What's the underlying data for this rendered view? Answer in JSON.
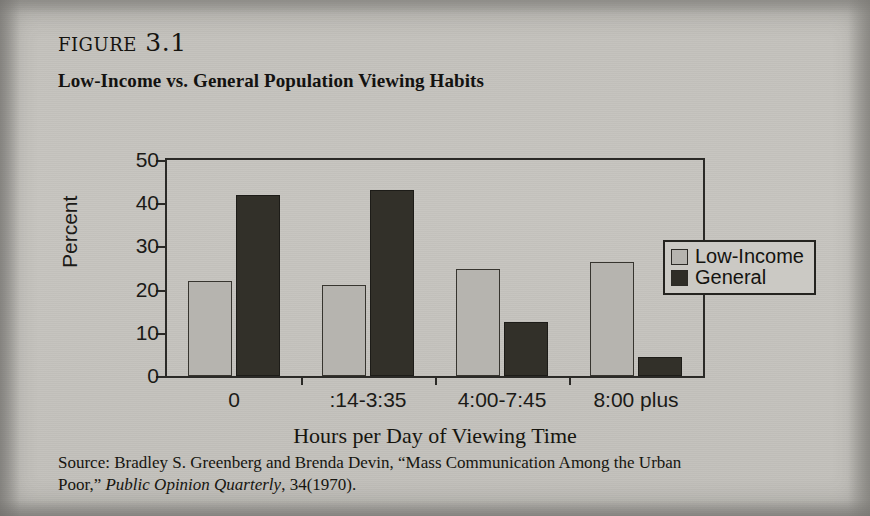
{
  "figure": {
    "label": "figure 3.1",
    "subtitle": "Low-Income vs. General Population Viewing Habits"
  },
  "legend": {
    "items": [
      {
        "label": "Low-Income",
        "color": "#b6b4af",
        "swatch": "light-gray-square"
      },
      {
        "label": "General",
        "color": "#2f2d27",
        "swatch": "black-square"
      }
    ]
  },
  "source": {
    "line1_prefix": "Source: Bradley S. Greenberg and Brenda Devin, “Mass Communication Among the Urban",
    "line2_prefix": "Poor,” ",
    "journal": "Public Opinion Quarterly",
    "line2_suffix": ", 34(1970)."
  },
  "chart_data": {
    "type": "bar",
    "title": "Low-Income vs. General Population Viewing Habits",
    "categories": [
      "0",
      ":14-3:35",
      "4:00-7:45",
      "8:00 plus"
    ],
    "series": [
      {
        "name": "Low-Income",
        "values": [
          22.0,
          21.0,
          24.7,
          26.5
        ],
        "color": "#b6b4af"
      },
      {
        "name": "General",
        "values": [
          42.0,
          43.0,
          12.6,
          4.5
        ],
        "color": "#2f2d27"
      }
    ],
    "xlabel": "Hours per Day of Viewing Time",
    "ylabel": "Percent",
    "ylim": [
      0,
      50
    ],
    "yticks": [
      0,
      10,
      20,
      30,
      40,
      50
    ],
    "ytick_labels": [
      "0",
      "10",
      "20",
      "30",
      "40",
      "50"
    ],
    "grid": false,
    "legend_position": "right"
  }
}
